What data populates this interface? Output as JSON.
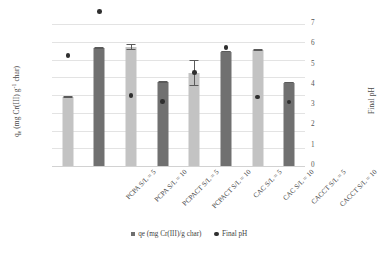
{
  "chart_data": {
    "type": "bar",
    "title": "",
    "xlabel": "",
    "ylabel": "qe (mg Cr(III) g-1 char)",
    "ylabel_secondary": "Final pH",
    "categories": [
      "PCPA S/L = 5",
      "PCPA S/L = 10",
      "PCPACT S/L = 5",
      "PCPACT S/L = 10",
      "CAC S/L = 5",
      "CAC S/L = 10",
      "CACCT S/L = 5",
      "CACCT S/L = 10"
    ],
    "series": [
      {
        "name": "qe (mg Cr(III)/g char)",
        "type": "bar",
        "axis": "left",
        "values": [
          3.88,
          6.65,
          6.7,
          4.73,
          5.25,
          6.45,
          6.55,
          4.7
        ],
        "errors": [
          0.06,
          0.05,
          0.15,
          0.05,
          0.75,
          0.05,
          0.05,
          0.05
        ],
        "bar_colors": [
          "light",
          "dark",
          "light",
          "dark",
          "light",
          "dark",
          "light",
          "dark"
        ]
      },
      {
        "name": "Final pH",
        "type": "scatter",
        "axis": "right",
        "values": [
          5.45,
          7.62,
          3.48,
          3.18,
          4.6,
          5.85,
          3.4,
          3.15
        ]
      }
    ],
    "ylim": [
      0,
      8
    ],
    "ylim_secondary": [
      0,
      7
    ],
    "yticks": [
      "0.00",
      "1.00",
      "2.00",
      "3.00",
      "4.00",
      "5.00",
      "6.00",
      "7.00",
      "8.00"
    ],
    "yticks_secondary": [
      "0",
      "1",
      "2",
      "3",
      "4",
      "5",
      "6",
      "7"
    ],
    "grid": true,
    "legend_position": "bottom",
    "colors": {
      "bar_light": "#c3c3c3",
      "bar_dark": "#707070",
      "marker": "#2f2f2f",
      "gridline": "#e3e3e3",
      "background": "#ffffff"
    }
  },
  "legend": {
    "items": [
      {
        "label": "qe (mg Cr(III)/g char)",
        "marker": "square"
      },
      {
        "label": "Final pH",
        "marker": "dot"
      }
    ]
  },
  "axis_titles": {
    "left_prefix": "q",
    "left_sub": "e",
    "left_main": " (mg Cr(III) g",
    "left_sup": "-1",
    "left_suffix": " char)",
    "right": "Final pH"
  }
}
